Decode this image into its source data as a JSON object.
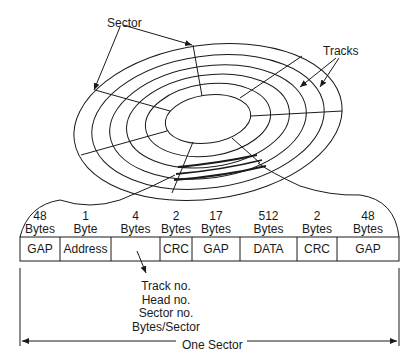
{
  "disk": {
    "sector_label": "Sector",
    "tracks_label": "Tracks"
  },
  "sector_format": {
    "fields": [
      {
        "size": "48",
        "unit": "Bytes",
        "name": "GAP"
      },
      {
        "size": "1",
        "unit": "Byte",
        "name": "Address"
      },
      {
        "size": "4",
        "unit": "Bytes",
        "name": ""
      },
      {
        "size": "2",
        "unit": "Bytes",
        "name": "CRC"
      },
      {
        "size": "17",
        "unit": "Bytes",
        "name": "GAP"
      },
      {
        "size": "512",
        "unit": "Bytes",
        "name": "DATA"
      },
      {
        "size": "2",
        "unit": "Bytes",
        "name": "CRC"
      },
      {
        "size": "48",
        "unit": "Bytes",
        "name": "GAP"
      }
    ],
    "id_field_contents": [
      "Track no.",
      "Head no.",
      "Sector no.",
      "Bytes/Sector"
    ],
    "span_label": "One Sector"
  }
}
